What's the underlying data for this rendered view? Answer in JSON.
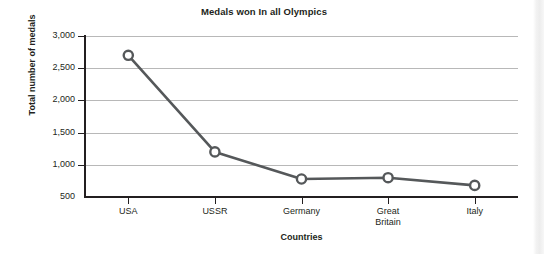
{
  "chart_data": {
    "type": "line",
    "title": "Medals won In all Olympics",
    "xlabel": "Countries",
    "ylabel": "Total number of medals",
    "categories": [
      "USA",
      "USSR",
      "Germany",
      "Great Britain",
      "Italy"
    ],
    "category_lines": [
      [
        "USA"
      ],
      [
        "USSR"
      ],
      [
        "Germany"
      ],
      [
        "Great",
        "Britain"
      ],
      [
        "Italy"
      ]
    ],
    "values": [
      2700,
      1200,
      780,
      800,
      680
    ],
    "series": [
      {
        "name": "Total number of medals",
        "values": [
          2700,
          1200,
          780,
          800,
          680
        ]
      }
    ],
    "ylim": [
      500,
      3000
    ],
    "ytick_values": [
      3000,
      2500,
      2000,
      1500,
      1000,
      500
    ],
    "ytick_labels": [
      "3,000",
      "2,500",
      "2,000",
      "1,500",
      "1,000",
      "500"
    ],
    "grid": true,
    "grid_axis": "y",
    "legend": "none",
    "marker": "open-circle",
    "line_color": "#55585a",
    "marker_color": "#55585a",
    "grid_color": "#b8b8b8",
    "axis_color": "#231f20",
    "text_color": "#231f20",
    "background": "#ffffff"
  }
}
